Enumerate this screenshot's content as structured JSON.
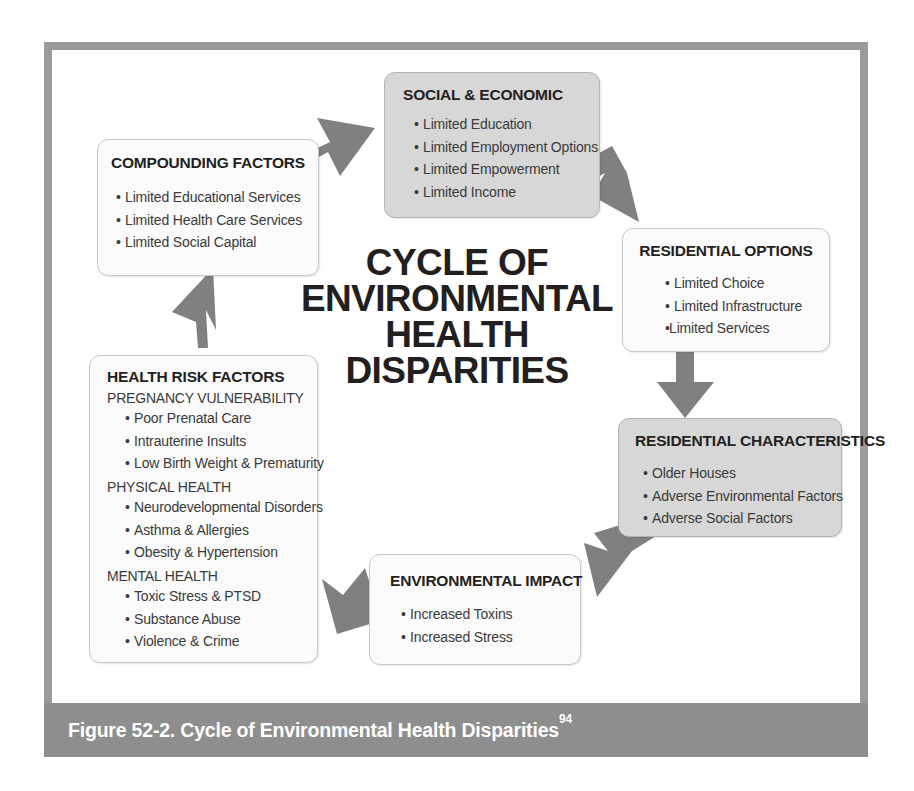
{
  "figure": {
    "caption": "Figure 52-2. Cycle of Environmental Health Disparities",
    "caption_superscript": "94",
    "center_title_lines": [
      "CYCLE OF",
      "ENVIRONMENTAL",
      "HEALTH",
      "DISPARITIES"
    ],
    "frame_border_color": "#9a9a9a",
    "caption_bar_color": "#8e8e8e",
    "arrow_color": "#808080",
    "shaded_node_color": "#d7d7d7",
    "light_node_color": "#fbfbfb"
  },
  "nodes": {
    "social_economic": {
      "title": "SOCIAL & ECONOMIC",
      "style": "shaded",
      "bullets": [
        "Limited Education",
        "Limited Employment Options",
        "Limited Empowerment",
        "Limited Income"
      ]
    },
    "compounding_factors": {
      "title": "COMPOUNDING FACTORS",
      "style": "light",
      "bullets": [
        "Limited Educational Services",
        "Limited Health Care Services",
        "Limited Social Capital"
      ]
    },
    "residential_options": {
      "title": "RESIDENTIAL OPTIONS",
      "style": "light",
      "bullets": [
        "Limited Choice",
        "Limited Infrastructure",
        "Limited Services"
      ]
    },
    "residential_characteristics": {
      "title": "RESIDENTIAL CHARACTERISTICS",
      "style": "shaded",
      "bullets": [
        "Older Houses",
        "Adverse Environmental Factors",
        "Adverse Social Factors"
      ]
    },
    "environmental_impact": {
      "title": "ENVIRONMENTAL IMPACT",
      "style": "light",
      "bullets": [
        "Increased Toxins",
        "Increased Stress"
      ]
    },
    "health_risk_factors": {
      "title": "HEALTH RISK FACTORS",
      "style": "light",
      "groups": [
        {
          "subhead": "PREGNANCY VULNERABILITY",
          "bullets": [
            "Poor Prenatal Care",
            "Intrauterine Insults",
            "Low Birth Weight & Prematurity"
          ]
        },
        {
          "subhead": "PHYSICAL HEALTH",
          "bullets": [
            "Neurodevelopmental Disorders",
            "Asthma & Allergies",
            "Obesity & Hypertension"
          ]
        },
        {
          "subhead": "MENTAL HEALTH",
          "bullets": [
            "Toxic Stress & PTSD",
            "Substance Abuse",
            "Violence & Crime"
          ]
        }
      ]
    }
  },
  "arrows": [
    {
      "name": "compounding-to-social",
      "from": "compounding_factors",
      "to": "social_economic",
      "direction": "up-right"
    },
    {
      "name": "social-to-residential-options",
      "from": "social_economic",
      "to": "residential_options",
      "direction": "down-right"
    },
    {
      "name": "residential-options-to-characteristics",
      "from": "residential_options",
      "to": "residential_characteristics",
      "direction": "down"
    },
    {
      "name": "characteristics-to-environmental-impact",
      "from": "residential_characteristics",
      "to": "environmental_impact",
      "direction": "down-left"
    },
    {
      "name": "environmental-impact-to-health-risk",
      "from": "environmental_impact",
      "to": "health_risk_factors",
      "direction": "left"
    },
    {
      "name": "health-risk-to-compounding",
      "from": "health_risk_factors",
      "to": "compounding_factors",
      "direction": "up"
    }
  ]
}
